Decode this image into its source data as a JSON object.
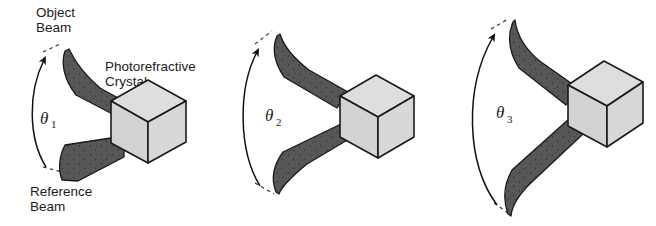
{
  "figure": {
    "background_color": "#ffffff",
    "beam_color": "#575757",
    "beam_stroke": "#1a1a1a",
    "crystal_top_color": "#dcdcdc",
    "crystal_left_color": "#cfcfcf",
    "crystal_right_color": "#d4d4d4",
    "outline_color": "#1a1a1a",
    "panels": [
      {
        "id": "panel-1",
        "angle_symbol": "θ",
        "angle_subscript": "1",
        "labels": {
          "object_beam_line1": "Object",
          "object_beam_line2": "Beam",
          "crystal_line1": "Photorefractive",
          "crystal_line2": "Crystal",
          "reference_beam_line1": "Reference",
          "reference_beam_line2": "Beam"
        }
      },
      {
        "id": "panel-2",
        "angle_symbol": "θ",
        "angle_subscript": "2",
        "labels": {}
      },
      {
        "id": "panel-3",
        "angle_symbol": "θ",
        "angle_subscript": "3",
        "labels": {}
      }
    ]
  }
}
